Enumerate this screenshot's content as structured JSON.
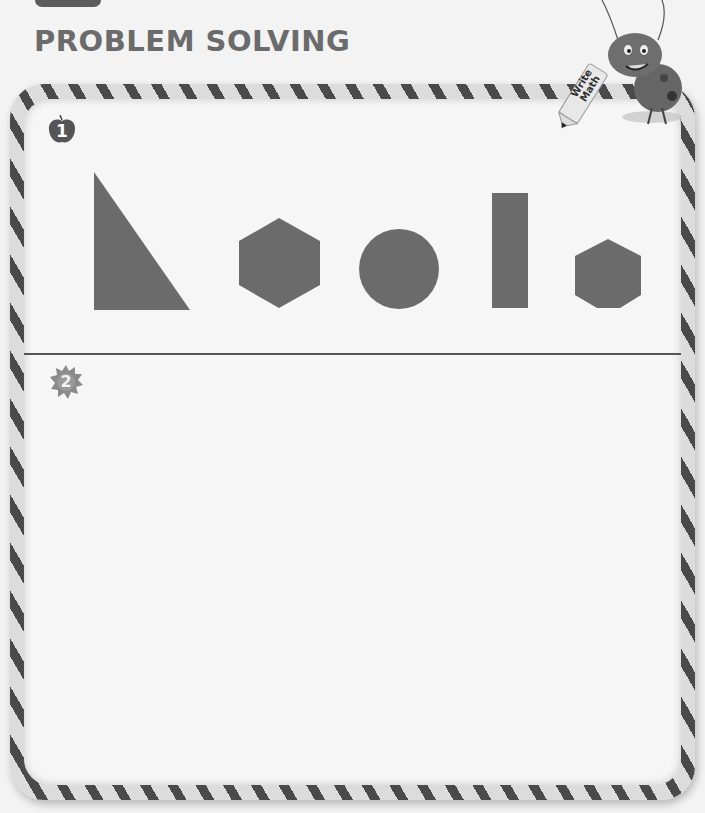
{
  "page": {
    "title": "PROBLEM SOLVING",
    "mascot_label_line1": "Write",
    "mascot_label_line2": "Math"
  },
  "problems": [
    {
      "number": "1",
      "marker_icon": "apple-icon",
      "shapes": [
        {
          "type": "right-triangle",
          "color": "#6b6b6b"
        },
        {
          "type": "hexagon",
          "color": "#6b6b6b"
        },
        {
          "type": "circle",
          "color": "#6b6b6b"
        },
        {
          "type": "rectangle",
          "color": "#6b6b6b"
        },
        {
          "type": "heptagon",
          "color": "#6b6b6b"
        }
      ]
    },
    {
      "number": "2",
      "marker_icon": "star-burst-icon"
    }
  ],
  "colors": {
    "shape_fill": "#6b6b6b",
    "title_text": "#6b6b6b",
    "frame_stripe_dark": "#4a4a4a",
    "frame_stripe_light": "#dcdcdc"
  }
}
